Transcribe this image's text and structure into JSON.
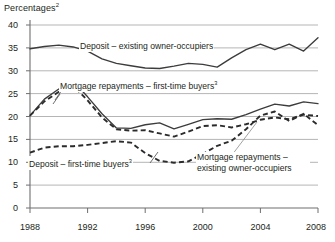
{
  "chart_data": {
    "type": "line",
    "title": "Percentages2",
    "title_text": "Percentages",
    "title_sup": "2",
    "xlabel": "",
    "ylabel": "Percentages",
    "xlim": [
      1988,
      2008
    ],
    "ylim": [
      0,
      40
    ],
    "ytick_labels": [
      "0",
      "5",
      "10",
      "15",
      "20",
      "25",
      "30",
      "35",
      "40"
    ],
    "yticks": [
      0,
      5,
      10,
      15,
      20,
      25,
      30,
      35,
      40
    ],
    "xtick_labels": [
      "1988",
      "1992",
      "1996",
      "2000",
      "2004",
      "2008"
    ],
    "xticks": [
      1988,
      1992,
      1996,
      2000,
      2004,
      2008
    ],
    "grid": "horizontal",
    "legend_position": "inline-annotations",
    "x": [
      1988,
      1989,
      1990,
      1991,
      1992,
      1993,
      1994,
      1995,
      1996,
      1997,
      1998,
      1999,
      2000,
      2001,
      2002,
      2003,
      2004,
      2005,
      2006,
      2007,
      2008
    ],
    "series": [
      {
        "name": "Deposit – existing owner-occupiers",
        "style": "solid",
        "color": "#3c3c3c",
        "values": [
          34.8,
          35.3,
          35.6,
          35.2,
          34.3,
          32.6,
          31.6,
          31.1,
          30.6,
          30.5,
          31.0,
          31.6,
          31.4,
          30.8,
          32.8,
          34.6,
          35.8,
          34.6,
          35.8,
          34.3,
          37.2
        ]
      },
      {
        "name": "Mortgage repayments – first-time buyers",
        "style": "solid",
        "color": "#3c3c3c",
        "values": [
          20.2,
          23.8,
          26.0,
          27.7,
          24.3,
          20.6,
          17.5,
          17.4,
          18.2,
          18.6,
          17.3,
          18.3,
          19.3,
          19.5,
          19.4,
          20.4,
          21.6,
          22.7,
          22.3,
          23.2,
          22.8
        ]
      },
      {
        "name": "Mortgage repayments – existing owner-occupiers",
        "style": "dashed",
        "color": "#2b2b2b",
        "values": [
          20.2,
          23.3,
          25.4,
          26.8,
          23.5,
          19.8,
          17.2,
          16.9,
          17.0,
          16.3,
          15.6,
          16.7,
          17.9,
          18.1,
          17.6,
          18.3,
          19.3,
          19.8,
          19.4,
          20.4,
          20.1
        ]
      },
      {
        "name": "Deposit – first-time buyers",
        "style": "dashed",
        "color": "#2b2b2b",
        "values": [
          12.1,
          13.2,
          13.5,
          13.5,
          13.8,
          14.2,
          14.6,
          14.3,
          12.0,
          10.3,
          9.9,
          10.2,
          11.8,
          13.6,
          14.7,
          17.2,
          20.2,
          21.1,
          19.0,
          20.6,
          18.1
        ]
      }
    ],
    "annotations": [
      {
        "name": "deposit-existing-owner-occupiers-label",
        "text": "Deposit – existing owner-occupiers",
        "sup": ""
      },
      {
        "name": "mortgage-repayments-first-time-buyers-label",
        "text": "Mortgage repayments – first-time buyers",
        "sup": "3"
      },
      {
        "name": "deposit-first-time-buyers-label",
        "text": "Deposit – first-time buyers",
        "sup": "3"
      },
      {
        "name": "mortgage-repayments-existing-owner-occupiers-label",
        "text": "Mortgage repayments – existing owner-occupiers",
        "sup": ""
      }
    ]
  },
  "labels": {
    "title_text": "Percentages",
    "title_sup": "2",
    "y0": "0",
    "y5": "5",
    "y10": "10",
    "y15": "15",
    "y20": "20",
    "y25": "25",
    "y30": "30",
    "y35": "35",
    "y40": "40",
    "x1988": "1988",
    "x1992": "1992",
    "x1996": "1996",
    "x2000": "2000",
    "x2004": "2004",
    "x2008": "2008",
    "ann_deposit_existing": "Deposit – existing owner-occupiers",
    "ann_mortgage_ftb": "Mortgage repayments – first-time buyers",
    "ann_mortgage_ftb_sup": "3",
    "ann_deposit_ftb": "Deposit – first-time buyers",
    "ann_deposit_ftb_sup": "3",
    "ann_mortgage_existing": "Mortgage repayments – existing owner-occupiers"
  },
  "colors": {
    "solid_line": "#3c3c3c",
    "dashed_line": "#2b2b2b",
    "gridline": "#a9a9a9",
    "axis": "#6e6e6e",
    "text": "#231f20",
    "background": "#ffffff"
  }
}
